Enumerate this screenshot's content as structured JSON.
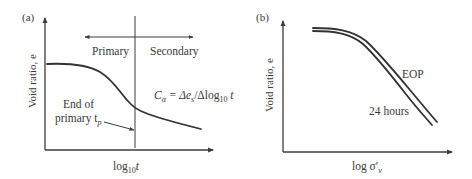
{
  "panel_a": {
    "label": "(a)",
    "y_axis_label": "Void ratio, e",
    "x_axis_label_main": "log",
    "x_axis_label_sub": "10",
    "x_axis_label_var": "t",
    "region_primary": "Primary",
    "region_secondary": "Secondary",
    "formula": {
      "lhs": "C",
      "lhs_sub": "α",
      "eq": " = Δe",
      "es_sub": "s",
      "mid": "/Δlog",
      "log_sub": "10",
      "end": " t"
    },
    "annotation_line1": "End of",
    "annotation_line2": "primary t",
    "annotation_sub": "p"
  },
  "panel_b": {
    "label": "(b)",
    "y_axis_label": "Void ratio, e",
    "x_axis_label_main": "log σ′",
    "x_axis_label_sub": "v",
    "curve_eop_label": "EOP",
    "curve_24h_label": "24 hours"
  },
  "colors": {
    "line": "#333333",
    "text": "#3a3a3a",
    "background": "#ffffff"
  }
}
